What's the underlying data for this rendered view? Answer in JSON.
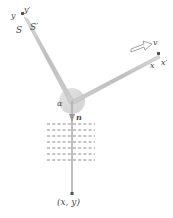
{
  "figure": {
    "labels": {
      "y_axis": "y",
      "y_axis_prime": "y′",
      "frame_S": "S",
      "frame_S_prime": "S′",
      "velocity": "v",
      "x_axis": "x",
      "x_axis_prime": "x′",
      "angle": "α",
      "normal": "n",
      "point": "(x, y)"
    },
    "colors": {
      "axis_gray": "#a8a8a8",
      "thick_axis_gray": "#b9b9b9",
      "disc_fill": "#d8d8d8",
      "text": "#4a4a4a",
      "hatch": "#808080",
      "arrow_outline": "#888888"
    },
    "geometry": {
      "origin": [
        72,
        103
      ],
      "y_axis_end": [
        22,
        16
      ],
      "x_axis_end": [
        160,
        56
      ],
      "n_axis_end": [
        72,
        196
      ],
      "disc_radius": 13,
      "hatch_rows": 7,
      "hatch_left": 47,
      "hatch_right": 95,
      "hatch_top": 124,
      "hatch_bottom": 160
    }
  }
}
